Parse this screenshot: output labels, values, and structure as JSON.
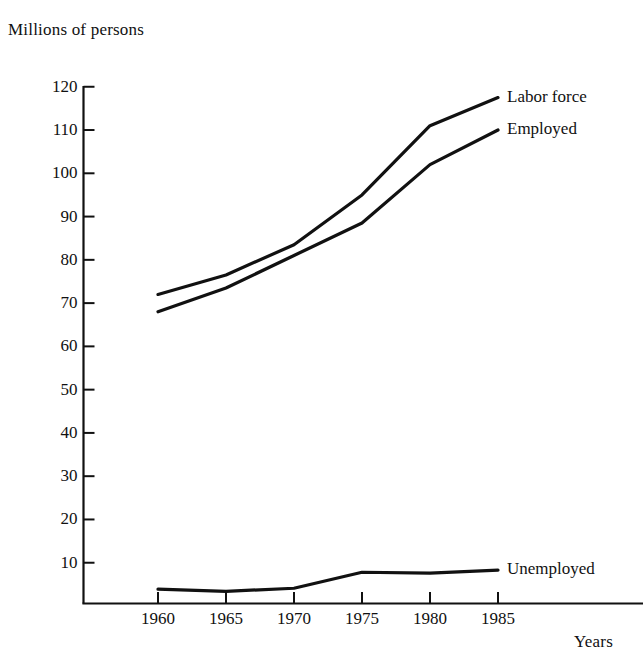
{
  "chart_data": {
    "type": "line",
    "title": "",
    "ylabel": "Millions of persons",
    "xlabel": "Years",
    "grid": false,
    "legend_position": "inline-right-of-line-ends",
    "x": [
      1960,
      1965,
      1970,
      1975,
      1980,
      1985
    ],
    "categories": [
      "1960",
      "1965",
      "1970",
      "1975",
      "1980",
      "1985"
    ],
    "xlim": [
      1958.5,
      1987.0
    ],
    "ylim": [
      0,
      124
    ],
    "yticks": [
      10,
      20,
      30,
      40,
      50,
      60,
      70,
      80,
      90,
      100,
      110,
      120
    ],
    "ytick_labels": [
      "10",
      "20",
      "30",
      "40",
      "50",
      "60",
      "70",
      "80",
      "90",
      "100",
      "110",
      "120"
    ],
    "xtick_labels": [
      "1960",
      "1965",
      "1970",
      "1975",
      "1980",
      "1985"
    ],
    "series": [
      {
        "name": "Labor force",
        "label": "Labor force",
        "values": [
          72,
          76.5,
          83.5,
          95,
          111,
          117.5
        ],
        "color": "#111111"
      },
      {
        "name": "Employed",
        "label": "Employed",
        "values": [
          68,
          73.5,
          81,
          88.5,
          102,
          110
        ],
        "color": "#111111"
      },
      {
        "name": "Unemployed",
        "label": "Unemployed",
        "values": [
          3.9,
          3.4,
          4.1,
          7.8,
          7.6,
          8.3
        ],
        "color": "#111111"
      }
    ]
  },
  "axes": {
    "y_axis_title": "Millions of persons",
    "x_axis_title": "Years"
  },
  "yticks": [
    {
      "label": "120"
    },
    {
      "label": "110"
    },
    {
      "label": "100"
    },
    {
      "label": "90"
    },
    {
      "label": "80"
    },
    {
      "label": "70"
    },
    {
      "label": "60"
    },
    {
      "label": "50"
    },
    {
      "label": "40"
    },
    {
      "label": "30"
    },
    {
      "label": "20"
    },
    {
      "label": "10"
    }
  ],
  "xticks": [
    {
      "label": "1960"
    },
    {
      "label": "1965"
    },
    {
      "label": "1970"
    },
    {
      "label": "1975"
    },
    {
      "label": "1980"
    },
    {
      "label": "1985"
    }
  ],
  "series_labels": [
    {
      "label": "Labor force"
    },
    {
      "label": "Employed"
    },
    {
      "label": "Unemployed"
    }
  ],
  "colors": {
    "line": "#111111",
    "axis": "#111111",
    "text": "#111111",
    "background": "#ffffff"
  }
}
